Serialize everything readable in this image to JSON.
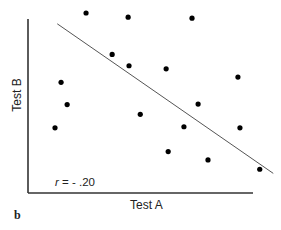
{
  "chart_data": {
    "type": "scatter",
    "title": "",
    "xlabel": "Test A",
    "ylabel": "Test B",
    "annotation": "r = - .20",
    "annotation_var": "r",
    "annotation_value": "= - .20",
    "panel_label": "b",
    "grid": false,
    "legend": null,
    "xlim": [
      0,
      10
    ],
    "ylim": [
      0,
      10
    ],
    "points": [
      {
        "x": 2.58,
        "y": 10.0
      },
      {
        "x": 4.45,
        "y": 9.77
      },
      {
        "x": 7.29,
        "y": 9.71
      },
      {
        "x": 3.74,
        "y": 7.7
      },
      {
        "x": 4.49,
        "y": 7.07
      },
      {
        "x": 6.14,
        "y": 6.9
      },
      {
        "x": 1.47,
        "y": 6.15
      },
      {
        "x": 9.33,
        "y": 6.44
      },
      {
        "x": 1.74,
        "y": 4.91
      },
      {
        "x": 4.99,
        "y": 4.37
      },
      {
        "x": 7.56,
        "y": 4.94
      },
      {
        "x": 1.2,
        "y": 3.62
      },
      {
        "x": 6.93,
        "y": 3.68
      },
      {
        "x": 9.42,
        "y": 3.62
      },
      {
        "x": 6.23,
        "y": 2.3
      },
      {
        "x": 8.0,
        "y": 1.84
      },
      {
        "x": 10.3,
        "y": 1.32
      }
    ],
    "trend_line": {
      "x1": 1.3,
      "y1": 9.4,
      "x2": 10.9,
      "y2": 1.09
    }
  },
  "style": {
    "point_color": "#000000",
    "line_color": "#555555",
    "axis_color": "#333333"
  },
  "layout": {
    "x0": 28,
    "x1": 253,
    "y0": 193,
    "y1": 13,
    "axis_top": 19
  }
}
